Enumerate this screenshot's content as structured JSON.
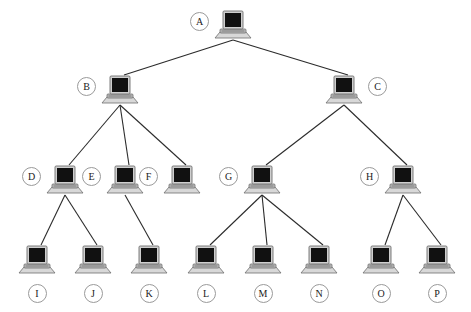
{
  "diagram": {
    "type": "tree",
    "background_color": "#ffffff",
    "edge_color": "#2b2b2b",
    "label_circle_border_color": "#9a9a9a",
    "label_circle_fill": "#ffffff",
    "icon_name": "laptop-icon",
    "icon_screen_color": "#111111",
    "icon_body_color": "#c9c9c9",
    "levels": 4,
    "node_count": 16,
    "edge_count": 15
  },
  "nodes": [
    {
      "id": "A",
      "label": "A",
      "x": 233,
      "y": 25,
      "label_side": "left",
      "level": 0
    },
    {
      "id": "B",
      "label": "B",
      "x": 120,
      "y": 90,
      "label_side": "left",
      "level": 1
    },
    {
      "id": "C",
      "label": "C",
      "x": 344,
      "y": 90,
      "label_side": "right",
      "level": 1
    },
    {
      "id": "D",
      "label": "D",
      "x": 65,
      "y": 180,
      "label_side": "left",
      "level": 2
    },
    {
      "id": "E",
      "label": "E",
      "x": 125,
      "y": 180,
      "label_side": "left",
      "level": 2
    },
    {
      "id": "F",
      "label": "F",
      "x": 182,
      "y": 180,
      "label_side": "left",
      "level": 2
    },
    {
      "id": "G",
      "label": "G",
      "x": 262,
      "y": 180,
      "label_side": "left",
      "level": 2
    },
    {
      "id": "H",
      "label": "H",
      "x": 403,
      "y": 180,
      "label_side": "left",
      "level": 2
    },
    {
      "id": "I",
      "label": "I",
      "x": 37,
      "y": 260,
      "label_side": "below",
      "level": 3
    },
    {
      "id": "J",
      "label": "J",
      "x": 93,
      "y": 260,
      "label_side": "below",
      "level": 3
    },
    {
      "id": "K",
      "label": "K",
      "x": 149,
      "y": 260,
      "label_side": "below",
      "level": 3
    },
    {
      "id": "L",
      "label": "L",
      "x": 206,
      "y": 260,
      "label_side": "below",
      "level": 3
    },
    {
      "id": "M",
      "label": "M",
      "x": 263,
      "y": 260,
      "label_side": "below",
      "level": 3
    },
    {
      "id": "N",
      "label": "N",
      "x": 319,
      "y": 260,
      "label_side": "below",
      "level": 3
    },
    {
      "id": "O",
      "label": "O",
      "x": 381,
      "y": 260,
      "label_side": "below",
      "level": 3
    },
    {
      "id": "P",
      "label": "P",
      "x": 437,
      "y": 260,
      "label_side": "below",
      "level": 3
    }
  ],
  "edges": [
    {
      "from": "A",
      "to": "B"
    },
    {
      "from": "A",
      "to": "C"
    },
    {
      "from": "B",
      "to": "D"
    },
    {
      "from": "B",
      "to": "E"
    },
    {
      "from": "B",
      "to": "F"
    },
    {
      "from": "C",
      "to": "G"
    },
    {
      "from": "C",
      "to": "H"
    },
    {
      "from": "D",
      "to": "I"
    },
    {
      "from": "D",
      "to": "J"
    },
    {
      "from": "E",
      "to": "K"
    },
    {
      "from": "G",
      "to": "L"
    },
    {
      "from": "G",
      "to": "M"
    },
    {
      "from": "G",
      "to": "N"
    },
    {
      "from": "H",
      "to": "O"
    },
    {
      "from": "H",
      "to": "P"
    }
  ]
}
